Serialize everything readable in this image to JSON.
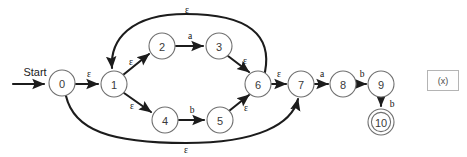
{
  "diagram": {
    "start_label": "Start",
    "states": [
      {
        "id": "0",
        "label": "0",
        "x": 62,
        "y": 83,
        "r": 13,
        "accepting": false
      },
      {
        "id": "1",
        "label": "1",
        "x": 114,
        "y": 84,
        "r": 13,
        "accepting": false
      },
      {
        "id": "2",
        "label": "2",
        "x": 162,
        "y": 46,
        "r": 13,
        "accepting": false
      },
      {
        "id": "3",
        "label": "3",
        "x": 219,
        "y": 46,
        "r": 13,
        "accepting": false
      },
      {
        "id": "4",
        "label": "4",
        "x": 165,
        "y": 120,
        "r": 13,
        "accepting": false
      },
      {
        "id": "5",
        "label": "5",
        "x": 220,
        "y": 120,
        "r": 13,
        "accepting": false
      },
      {
        "id": "6",
        "label": "6",
        "x": 258,
        "y": 84,
        "r": 13,
        "accepting": false
      },
      {
        "id": "7",
        "label": "7",
        "x": 301,
        "y": 84,
        "r": 13,
        "accepting": false
      },
      {
        "id": "8",
        "label": "8",
        "x": 343,
        "y": 84,
        "r": 13,
        "accepting": false
      },
      {
        "id": "9",
        "label": "9",
        "x": 381,
        "y": 84,
        "r": 13,
        "accepting": false
      },
      {
        "id": "10",
        "label": "10",
        "x": 381,
        "y": 122,
        "r": 13,
        "accepting": true
      }
    ],
    "transitions": [
      {
        "from": "start",
        "to": "0",
        "symbol": "",
        "kind": "start-arrow"
      },
      {
        "from": "0",
        "to": "1",
        "symbol": "ε",
        "kind": "straight"
      },
      {
        "from": "1",
        "to": "2",
        "symbol": "ε",
        "kind": "straight"
      },
      {
        "from": "1",
        "to": "4",
        "symbol": "ε",
        "kind": "straight"
      },
      {
        "from": "2",
        "to": "3",
        "symbol": "a",
        "kind": "straight"
      },
      {
        "from": "4",
        "to": "5",
        "symbol": "b",
        "kind": "straight"
      },
      {
        "from": "3",
        "to": "6",
        "symbol": "ε",
        "kind": "straight"
      },
      {
        "from": "5",
        "to": "6",
        "symbol": "ε",
        "kind": "straight"
      },
      {
        "from": "6",
        "to": "1",
        "symbol": "ε",
        "kind": "arc-top"
      },
      {
        "from": "6",
        "to": "7",
        "symbol": "ε",
        "kind": "straight"
      },
      {
        "from": "0",
        "to": "7",
        "symbol": "ε",
        "kind": "arc-bottom"
      },
      {
        "from": "7",
        "to": "8",
        "symbol": "a",
        "kind": "straight"
      },
      {
        "from": "8",
        "to": "9",
        "symbol": "b",
        "kind": "straight"
      },
      {
        "from": "9",
        "to": "10",
        "symbol": "b",
        "kind": "straight-down"
      }
    ],
    "edge_labels": {
      "start": "Start",
      "e0_1": "ε",
      "e1_2": "ε",
      "e1_4": "ε",
      "e2_3": "a",
      "e4_5": "b",
      "e3_6": "ε",
      "e5_6": "ε",
      "e6_1_arc": "ε",
      "e6_7": "ε",
      "e0_7_arc": "ε",
      "e7_8": "a",
      "e8_9": "b",
      "e9_10": "b"
    },
    "colors": {
      "background": "#ffffff",
      "edge": "#1c1c1c",
      "state_stroke": "#6f6f6f",
      "state_fill": "#ffffff",
      "state_text": "#3a3a3a",
      "label_text": "#111111",
      "aux_border": "#b4b4b4",
      "aux_text": "#4a4a4a"
    }
  },
  "aux_box": {
    "label": "(x)",
    "x": 427,
    "y": 70,
    "width": 32,
    "height": 21,
    "font_size": 9
  }
}
